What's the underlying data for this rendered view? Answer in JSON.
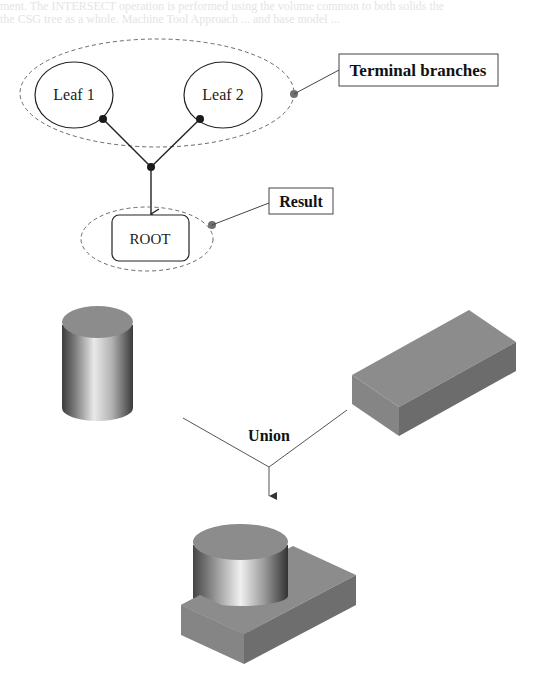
{
  "bleed_text": {
    "line1": "ment. The INTERSECT operation is performed using the volume common to both solids the",
    "line2": "the CSG tree as a whole. Machine Tool Approach ... and base model ..."
  },
  "tree": {
    "leaf1_label": "Leaf 1",
    "leaf2_label": "Leaf 2",
    "root_label": "ROOT",
    "callout_terminal": "Terminal branches",
    "callout_result": "Result"
  },
  "operation": {
    "label": "Union"
  },
  "colors": {
    "dashed_outline": "#6a6a6a",
    "node_stroke": "#222222",
    "callout_dot": "#6f6f6f",
    "solid_face": "#8a8a8a",
    "solid_dark_face": "#707070",
    "solid_light_face": "#8c8c8c"
  },
  "shapes": {
    "cylinder": "cylinder-solid",
    "box": "box-solid",
    "result": "union-result-solid"
  }
}
